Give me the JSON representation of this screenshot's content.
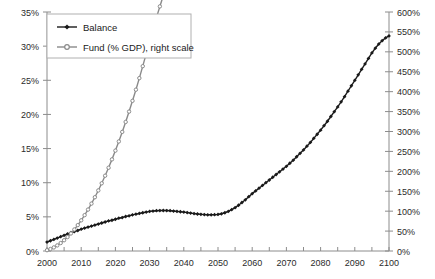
{
  "chart_data": {
    "type": "line",
    "title": "",
    "subtitle": "",
    "xlabel": "",
    "ylabel": "",
    "y2label": "",
    "grid": false,
    "legend_position": "top-left",
    "xlim": [
      2000,
      2100
    ],
    "ylim": [
      0,
      35
    ],
    "y2lim": [
      0,
      600
    ],
    "x_tick_labels": [
      "2000",
      "2010",
      "2020",
      "2030",
      "2040",
      "2050",
      "2060",
      "2070",
      "2080",
      "2090",
      "2100"
    ],
    "x_major_ticks": [
      2000,
      2010,
      2020,
      2030,
      2040,
      2050,
      2060,
      2070,
      2080,
      2090,
      2100
    ],
    "x_minor_tick_step": 5,
    "y_tick_labels": [
      "0%",
      "5%",
      "10%",
      "15%",
      "20%",
      "25%",
      "30%",
      "35%"
    ],
    "y_ticks": [
      0,
      5,
      10,
      15,
      20,
      25,
      30,
      35
    ],
    "y2_tick_labels": [
      "0%",
      "50%",
      "100%",
      "150%",
      "200%",
      "250%",
      "300%",
      "350%",
      "400%",
      "450%",
      "500%",
      "550%",
      "600%"
    ],
    "y2_ticks": [
      0,
      50,
      100,
      150,
      200,
      250,
      300,
      350,
      400,
      450,
      500,
      550,
      600
    ],
    "x": [
      2000,
      2001,
      2002,
      2003,
      2004,
      2005,
      2006,
      2007,
      2008,
      2009,
      2010,
      2011,
      2012,
      2013,
      2014,
      2015,
      2016,
      2017,
      2018,
      2019,
      2020,
      2021,
      2022,
      2023,
      2024,
      2025,
      2026,
      2027,
      2028,
      2029,
      2030,
      2031,
      2032,
      2033,
      2034,
      2035,
      2036,
      2037,
      2038,
      2039,
      2040,
      2041,
      2042,
      2043,
      2044,
      2045,
      2046,
      2047,
      2048,
      2049,
      2050,
      2051,
      2052,
      2053,
      2054,
      2055,
      2056,
      2057,
      2058,
      2059,
      2060,
      2061,
      2062,
      2063,
      2064,
      2065,
      2066,
      2067,
      2068,
      2069,
      2070,
      2071,
      2072,
      2073,
      2074,
      2075,
      2076,
      2077,
      2078,
      2079,
      2080,
      2081,
      2082,
      2083,
      2084,
      2085,
      2086,
      2087,
      2088,
      2089,
      2090,
      2091,
      2092,
      2093,
      2094,
      2095,
      2096,
      2097,
      2098,
      2099,
      2100
    ],
    "series": [
      {
        "name": "Balance",
        "axis": "left",
        "color": "#1a1a1a",
        "marker": "diamond",
        "values": [
          1.3,
          1.5,
          1.7,
          1.9,
          2.1,
          2.3,
          2.5,
          2.7,
          2.85,
          3.0,
          3.2,
          3.35,
          3.5,
          3.65,
          3.8,
          3.95,
          4.1,
          4.25,
          4.4,
          4.5,
          4.65,
          4.8,
          4.9,
          5.05,
          5.15,
          5.3,
          5.4,
          5.5,
          5.6,
          5.7,
          5.8,
          5.85,
          5.9,
          5.92,
          5.93,
          5.92,
          5.9,
          5.85,
          5.8,
          5.75,
          5.7,
          5.62,
          5.55,
          5.48,
          5.42,
          5.37,
          5.33,
          5.3,
          5.3,
          5.32,
          5.35,
          5.45,
          5.6,
          5.8,
          6.05,
          6.35,
          6.7,
          7.1,
          7.5,
          7.95,
          8.4,
          8.8,
          9.2,
          9.6,
          10.0,
          10.4,
          10.8,
          11.2,
          11.6,
          12.0,
          12.4,
          12.85,
          13.3,
          13.8,
          14.3,
          14.8,
          15.35,
          15.9,
          16.5,
          17.1,
          17.7,
          18.35,
          19.0,
          19.7,
          20.4,
          21.1,
          21.85,
          22.6,
          23.4,
          24.2,
          25.0,
          25.8,
          26.6,
          27.4,
          28.2,
          29.0,
          29.7,
          30.3,
          30.8,
          31.2,
          31.5
        ]
      },
      {
        "name": "Fund (% GDP), right scale",
        "axis": "right",
        "color": "#8a8a8a",
        "marker": "circle",
        "values": [
          2,
          5,
          9,
          14,
          20,
          27,
          35,
          44,
          54,
          65,
          77,
          90,
          104,
          119,
          135,
          152,
          170,
          189,
          209,
          230,
          252,
          275,
          299,
          324,
          350,
          377,
          405,
          434,
          464,
          495,
          527,
          557,
          586,
          614,
          641,
          667,
          692,
          716,
          739,
          761,
          782,
          802,
          821,
          839,
          856,
          872,
          887,
          901,
          914,
          926,
          937,
          948,
          959,
          971,
          984,
          998,
          1013,
          1030,
          1048,
          1068,
          1090,
          1114,
          1140,
          1168,
          1198,
          1230,
          1264,
          1300,
          1338,
          1378,
          1420,
          1465,
          1512,
          1561,
          1612,
          1665,
          1720,
          1778,
          1838,
          1900,
          1965,
          2032,
          2102,
          2175,
          2251,
          2330,
          2412,
          2497,
          2585,
          2676,
          2770,
          2867,
          2967,
          3070,
          3176,
          3285,
          3397,
          3512,
          3630,
          3751,
          3875
        ]
      }
    ],
    "series_right_scaled_note": "Fund values plotted on right axis in percent of GDP"
  },
  "legend": {
    "entries": [
      {
        "label": "Balance"
      },
      {
        "label": "Fund (% GDP), right scale"
      }
    ]
  }
}
